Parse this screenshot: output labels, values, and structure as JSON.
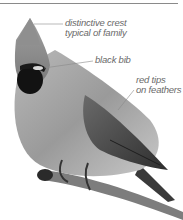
{
  "figure": {
    "labels": [
      {
        "id": "crest",
        "lines": [
          "distinctive crest",
          "typical of family"
        ]
      },
      {
        "id": "bib",
        "lines": [
          "black bib"
        ]
      },
      {
        "id": "tips",
        "lines": [
          "red tips",
          "on feathers"
        ]
      }
    ]
  }
}
